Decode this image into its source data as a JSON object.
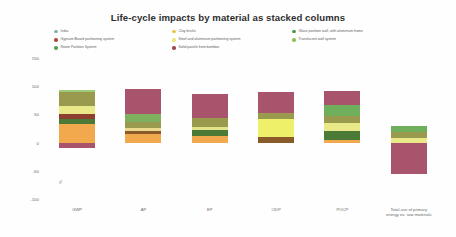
{
  "chart_data": {
    "type": "bar",
    "title": "Life-cycle impacts by material as stacked columns",
    "subtitle": "",
    "xlabel": "",
    "ylabel": "%",
    "ylim": [
      -100,
      150
    ],
    "yticks": [
      150,
      100,
      50,
      0,
      -50,
      -100
    ],
    "grid": false,
    "legend_position": "top",
    "stacked": true,
    "categories": [
      "GWP",
      "AP",
      "EP",
      "ODP",
      "POCP",
      "Total use of primary\nenergy ex. raw materials"
    ],
    "series": [
      {
        "name": "India",
        "color": "#7fb77e",
        "values": [
          4,
          0,
          0,
          0,
          0,
          0
        ]
      },
      {
        "name": "Gypsum Board partitioning system",
        "color": "#b5483c",
        "values": [
          0,
          0,
          0,
          0,
          0,
          0
        ]
      },
      {
        "name": "Room Partition System",
        "color": "#5a9e4e",
        "values": [
          0,
          0,
          0,
          0,
          0,
          0
        ]
      },
      {
        "name": "Clay bricks",
        "color": "#e8c84c",
        "values": [
          0,
          0,
          0,
          0,
          0,
          0
        ]
      },
      {
        "name": "Steel and aluminium partitioning system",
        "color": "#eff06a",
        "values": [
          0,
          0,
          0,
          0,
          0,
          0
        ]
      },
      {
        "name": "Solid panels from bamboo",
        "color": "#9e4a52",
        "values": [
          0,
          0,
          0,
          0,
          0,
          0
        ]
      },
      {
        "name": "Glass partition wall, with aluminium frame",
        "color": "#4f9b4a",
        "values": [
          0,
          0,
          0,
          0,
          0,
          0
        ]
      },
      {
        "name": "Translucent wall system",
        "color": "#8fbf5a",
        "values": [
          0,
          0,
          0,
          0,
          0,
          0
        ]
      }
    ],
    "columns": [
      {
        "label": "GWP",
        "segments": [
          {
            "name": "light-green-cap",
            "color": "#9ccb77",
            "value": 5
          },
          {
            "name": "olive-band",
            "color": "#9a9a4e",
            "value": 25
          },
          {
            "name": "pale-yellow-band",
            "color": "#e9e98a",
            "value": 14
          },
          {
            "name": "dark-red-band",
            "color": "#8e4030",
            "value": 8
          },
          {
            "name": "dark-green-band",
            "color": "#4a7a35",
            "value": 9
          },
          {
            "name": "orange-band",
            "color": "#f2a94e",
            "value": 33
          },
          {
            "name": "mauve-base",
            "color": "#a8546d",
            "value": -9
          }
        ]
      },
      {
        "label": "AP",
        "segments": [
          {
            "name": "mauve-top",
            "color": "#a8546d",
            "value": 45
          },
          {
            "name": "green-band",
            "color": "#7fb05f",
            "value": 14
          },
          {
            "name": "olive-band",
            "color": "#9a9a4e",
            "value": 11
          },
          {
            "name": "cream-band",
            "color": "#ecd98e",
            "value": 5
          },
          {
            "name": "brown-band",
            "color": "#8a5a2a",
            "value": 5
          },
          {
            "name": "orange-base",
            "color": "#f2a94e",
            "value": 15
          }
        ]
      },
      {
        "label": "EP",
        "segments": [
          {
            "name": "mauve-top",
            "color": "#a8546d",
            "value": 42
          },
          {
            "name": "olive-band",
            "color": "#9a9a4e",
            "value": 16
          },
          {
            "name": "pale-yellow-band",
            "color": "#e3e38a",
            "value": 6
          },
          {
            "name": "dark-green-band",
            "color": "#4a7a35",
            "value": 10
          },
          {
            "name": "orange-base",
            "color": "#f2a94e",
            "value": 12
          }
        ]
      },
      {
        "label": "ODP",
        "segments": [
          {
            "name": "mauve-top",
            "color": "#a8546d",
            "value": 37
          },
          {
            "name": "olive-band",
            "color": "#9a9a4e",
            "value": 10
          },
          {
            "name": "bright-yellow-band",
            "color": "#eff06a",
            "value": 32
          },
          {
            "name": "brown-base",
            "color": "#8a5a2a",
            "value": 10
          }
        ]
      },
      {
        "label": "POCP",
        "segments": [
          {
            "name": "mauve-top",
            "color": "#a8546d",
            "value": 25
          },
          {
            "name": "green-band",
            "color": "#6fae5a",
            "value": 18
          },
          {
            "name": "olive-band",
            "color": "#9a9a4e",
            "value": 13
          },
          {
            "name": "pale-yellow-band",
            "color": "#e9e98a",
            "value": 14
          },
          {
            "name": "dark-green-band",
            "color": "#4a7a35",
            "value": 16
          },
          {
            "name": "orange-base",
            "color": "#f2a94e",
            "value": 5
          }
        ]
      },
      {
        "label": "Total use of primary\nenergy ex. raw materials",
        "segments": [
          {
            "name": "green-cap",
            "color": "#6fae5a",
            "value": 12
          },
          {
            "name": "olive-band",
            "color": "#9a9a4e",
            "value": 10
          },
          {
            "name": "pale-yellow-band",
            "color": "#e9e98a",
            "value": 8
          },
          {
            "name": "mauve-base",
            "color": "#a8546d",
            "value": -56
          }
        ]
      }
    ]
  },
  "legend": {
    "columns": [
      {
        "items": [
          {
            "label": "India",
            "color": "#7fb7a8"
          },
          {
            "label": "Gypsum Board partitioning system",
            "color": "#b5483c"
          },
          {
            "label": "Room Partition System",
            "color": "#5a9e4e"
          }
        ]
      },
      {
        "items": [
          {
            "label": "Clay bricks",
            "color": "#e8c84c"
          },
          {
            "label": "Steel and aluminium partitioning system",
            "color": "#eae87a"
          },
          {
            "label": "Solid panels from bamboo",
            "color": "#9e4a52"
          }
        ]
      },
      {
        "items": [
          {
            "label": "Glass partition wall, with aluminium frame",
            "color": "#4f9b4a"
          },
          {
            "label": "Translucent wall system",
            "color": "#8fbf5a"
          }
        ]
      }
    ]
  }
}
